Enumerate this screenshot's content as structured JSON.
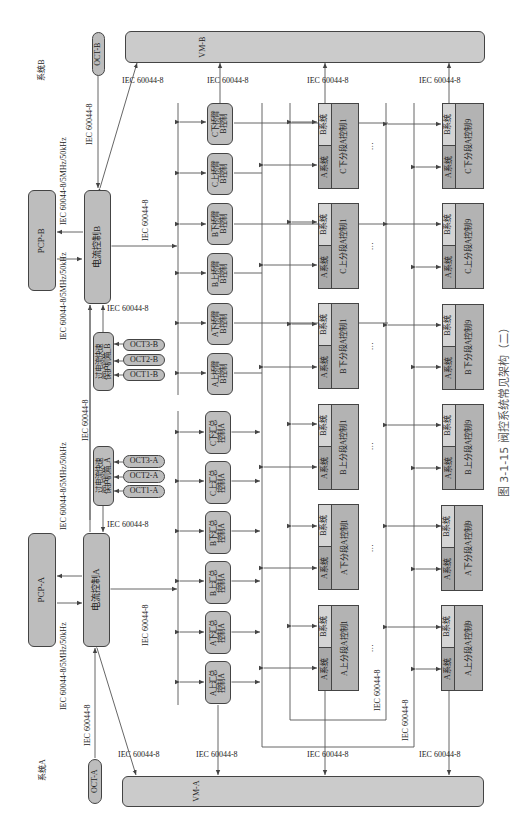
{
  "figure": {
    "caption": "图 3-1-15  阀控系统常见架构（二）",
    "orientation": "rotated 90° counter-clockwise",
    "system_labels": {
      "system_a": "系统A",
      "system_b": "系统B"
    },
    "protocol": "IEC 60044-8",
    "protocol_pcp": "IEC 60044-8/5MHz/50kHz"
  },
  "top_level": {
    "vm_a": "VM-A",
    "vm_b": "VM-B",
    "oct_a": "OCT-A",
    "oct_b": "OCT-B",
    "pcp_a": "PCP-A",
    "pcp_b": "PCP-B",
    "current_ctrl_a": "电流控制A",
    "current_ctrl_b": "电流控制B"
  },
  "protection": {
    "a": {
      "label": "过电流快速保护机箱_A",
      "line1": "过电流快速",
      "line2": "保护机箱_A",
      "octs": [
        "OCT3-A",
        "OCT2-A",
        "OCT1-A"
      ]
    },
    "b": {
      "label": "过电流快速保护机箱_B",
      "line1": "过电流快速",
      "line2": "保护机箱_B",
      "octs": [
        "OCT3-B",
        "OCT2-B",
        "OCT1-B"
      ]
    }
  },
  "bridge_controls_b": [
    {
      "l1": "C下桥臂",
      "l2": "B控制"
    },
    {
      "l1": "C上桥臂",
      "l2": "B控制"
    },
    {
      "l1": "B下桥臂",
      "l2": "B控制"
    },
    {
      "l1": "B上桥臂",
      "l2": "B控制"
    },
    {
      "l1": "A下桥臂",
      "l2": "B控制"
    },
    {
      "l1": "A上桥臂",
      "l2": "B控制"
    }
  ],
  "summary_controls_a": [
    {
      "l1": "C下汇总",
      "l2": "控制A"
    },
    {
      "l1": "C上汇总",
      "l2": "控制A"
    },
    {
      "l1": "B下汇总",
      "l2": "控制A"
    },
    {
      "l1": "B上汇总",
      "l2": "控制A"
    },
    {
      "l1": "A下汇总",
      "l2": "控制A"
    },
    {
      "l1": "A上汇总",
      "l2": "控制A"
    }
  ],
  "segment_labels": {
    "a_sys": "A系统",
    "b_sys": "B系统",
    "ellipsis": "…"
  },
  "segments_col1": [
    "C下分段A控制1",
    "C上分段A控制1",
    "B下分段A控制1",
    "B上分段A控制1",
    "A下分段A控制1",
    "A上分段A控制1"
  ],
  "segments_col9": [
    "C下分段A控制9",
    "C上分段A控制9",
    "B下分段A控制9",
    "B上分段A控制9",
    "A下分段A控制9",
    "A上分段A控制9"
  ]
}
